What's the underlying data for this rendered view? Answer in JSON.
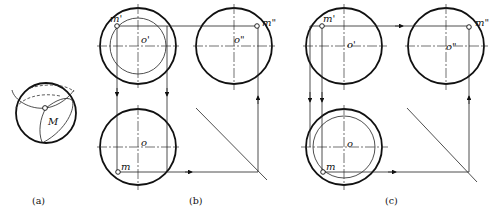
{
  "figure": {
    "panel_a": {
      "caption": "(a)",
      "point_label": "M"
    },
    "panel_b": {
      "caption": "(b)",
      "front_view": {
        "center_label": "o'",
        "point_label": "m'"
      },
      "side_view": {
        "center_label": "o\"",
        "point_label": "m\""
      },
      "top_view": {
        "center_label": "o",
        "point_label": "m"
      }
    },
    "panel_c": {
      "caption": "(c)",
      "front_view": {
        "center_label": "o'",
        "point_label": "m'"
      },
      "side_view": {
        "center_label": "o\"",
        "point_label": "m\""
      },
      "top_view": {
        "center_label": "o",
        "point_label": "m"
      }
    }
  }
}
